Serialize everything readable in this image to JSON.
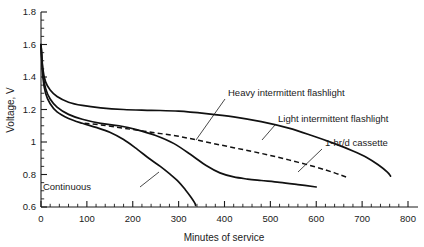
{
  "chart_data": {
    "type": "line",
    "title": "",
    "xlabel": "Minutes of service",
    "ylabel": "Voltage, V",
    "xlim": [
      0,
      800
    ],
    "ylim": [
      0.6,
      1.8
    ],
    "grid": false,
    "legend_position": "inline-annotations",
    "x_ticks": [
      0,
      100,
      200,
      300,
      400,
      500,
      600,
      700,
      800
    ],
    "x_tick_labels": [
      "0",
      "100",
      "200",
      "300",
      "400",
      "500",
      "600",
      "700",
      "800"
    ],
    "x_minor_tick_step": 20,
    "y_ticks": [
      0.6,
      0.8,
      1.0,
      1.2,
      1.4,
      1.6,
      1.8
    ],
    "y_tick_labels": [
      "0.6",
      "0.8",
      "1",
      "1.2",
      "1.4",
      "1.6",
      "1.8"
    ],
    "y_minor_tick_step": 0.05,
    "series": [
      {
        "name": "Light intermittent flashlight",
        "style": "solid",
        "label": "Light intermittent flashlight",
        "x": [
          0,
          4,
          10,
          20,
          35,
          60,
          90,
          130,
          180,
          240,
          300,
          360,
          420,
          480,
          540,
          590,
          640,
          680,
          710,
          735,
          755,
          762
        ],
        "y": [
          1.6,
          1.45,
          1.37,
          1.32,
          1.28,
          1.245,
          1.225,
          1.21,
          1.2,
          1.195,
          1.19,
          1.175,
          1.155,
          1.125,
          1.085,
          1.04,
          0.99,
          0.945,
          0.905,
          0.86,
          0.815,
          0.79
        ]
      },
      {
        "name": "Heavy intermittent flashlight",
        "style": "solid",
        "label": "Heavy intermittent flashlight",
        "x": [
          0,
          4,
          10,
          20,
          35,
          60,
          90,
          130,
          170,
          210,
          250,
          290,
          330,
          360,
          390,
          420,
          450,
          480,
          520,
          560,
          600
        ],
        "y": [
          1.6,
          1.43,
          1.33,
          1.265,
          1.215,
          1.17,
          1.14,
          1.115,
          1.1,
          1.075,
          1.04,
          0.99,
          0.915,
          0.855,
          0.81,
          0.785,
          0.772,
          0.763,
          0.752,
          0.738,
          0.723
        ]
      },
      {
        "name": "1-hr/d cassette",
        "style": "dashed",
        "label": "1-hr/d cassette",
        "x": [
          95,
          130,
          180,
          240,
          300,
          360,
          420,
          480,
          540,
          600,
          640,
          665
        ],
        "y": [
          1.115,
          1.105,
          1.085,
          1.06,
          1.035,
          1.0,
          0.965,
          0.93,
          0.89,
          0.845,
          0.81,
          0.785
        ]
      },
      {
        "name": "Continuous",
        "style": "solid",
        "label": "Continuous",
        "x": [
          0,
          4,
          10,
          20,
          35,
          60,
          90,
          120,
          150,
          180,
          210,
          235,
          260,
          280,
          300,
          315,
          327,
          335,
          337
        ],
        "y": [
          1.6,
          1.4,
          1.3,
          1.235,
          1.185,
          1.145,
          1.115,
          1.09,
          1.06,
          1.015,
          0.955,
          0.9,
          0.85,
          0.805,
          0.755,
          0.705,
          0.66,
          0.625,
          0.61
        ]
      }
    ],
    "annotations": [
      {
        "text": "Heavy intermittent flashlight",
        "label_x_px": 228,
        "label_y_px": 96,
        "leader_from_px": [
          225,
          99
        ],
        "leader_to_px": [
          196,
          140
        ]
      },
      {
        "text": "Light intermittent flashlight",
        "label_x_px": 278,
        "label_y_px": 122,
        "leader_from_px": [
          275,
          125
        ],
        "leader_to_px": [
          262,
          140
        ]
      },
      {
        "text": "1-hr/d cassette",
        "label_x_px": 325,
        "label_y_px": 146,
        "leader_from_px": [
          322,
          149
        ],
        "leader_to_px": [
          298,
          172
        ]
      },
      {
        "text": "Continuous",
        "label_x_px": 91,
        "label_y_px": 190,
        "leader_from_px": [
          140,
          187
        ],
        "leader_to_px": [
          159,
          172
        ]
      }
    ]
  }
}
